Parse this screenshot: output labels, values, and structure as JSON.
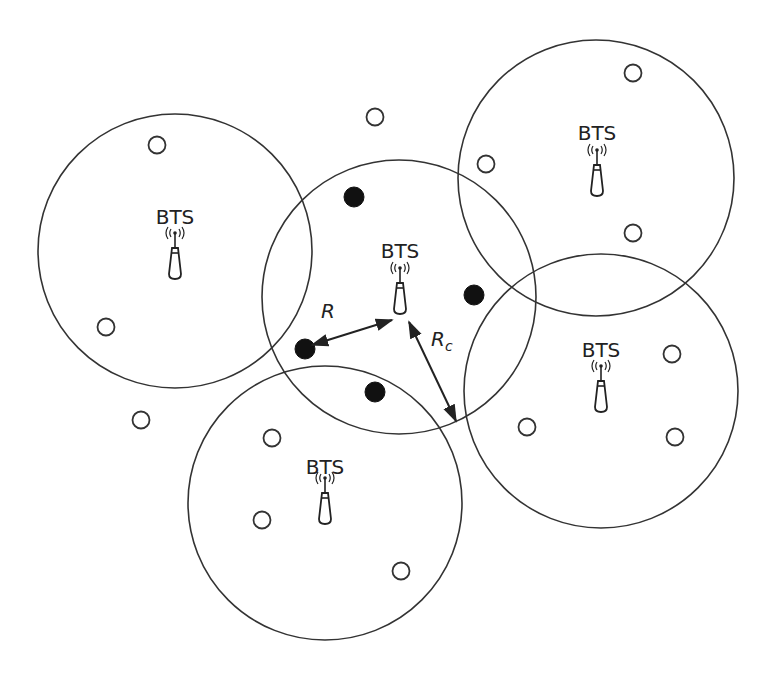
{
  "diagram": {
    "colors": {
      "line": "#333333",
      "active_station": "#111111",
      "idle_station": "#ffffff",
      "background": "#ffffff"
    },
    "cells": [
      {
        "id": "left",
        "label": "BTS",
        "cx": 175,
        "cy": 251,
        "r": 137,
        "label_x": 175,
        "label_y": 224,
        "antenna_x": 175,
        "antenna_y": 226
      },
      {
        "id": "top-right",
        "label": "BTS",
        "cx": 596,
        "cy": 178,
        "r": 138,
        "label_x": 597,
        "label_y": 140,
        "antenna_x": 597,
        "antenna_y": 143
      },
      {
        "id": "center",
        "label": "BTS",
        "cx": 399,
        "cy": 297,
        "r": 137,
        "label_x": 400,
        "label_y": 258,
        "antenna_x": 400,
        "antenna_y": 261
      },
      {
        "id": "bottom-right",
        "label": "BTS",
        "cx": 601,
        "cy": 391,
        "r": 137,
        "label_x": 601,
        "label_y": 357,
        "antenna_x": 601,
        "antenna_y": 359
      },
      {
        "id": "bottom",
        "label": "BTS",
        "cx": 325,
        "cy": 503,
        "r": 137,
        "label_x": 325,
        "label_y": 474,
        "antenna_x": 325,
        "antenna_y": 471
      }
    ],
    "active_mobiles": [
      {
        "x": 354,
        "y": 197
      },
      {
        "x": 474,
        "y": 295
      },
      {
        "x": 305,
        "y": 349
      },
      {
        "x": 375,
        "y": 392
      }
    ],
    "idle_mobiles": [
      {
        "x": 157,
        "y": 145
      },
      {
        "x": 106,
        "y": 327
      },
      {
        "x": 375,
        "y": 117
      },
      {
        "x": 141,
        "y": 420
      },
      {
        "x": 486,
        "y": 164
      },
      {
        "x": 633,
        "y": 73
      },
      {
        "x": 633,
        "y": 233
      },
      {
        "x": 672,
        "y": 354
      },
      {
        "x": 527,
        "y": 427
      },
      {
        "x": 675,
        "y": 437
      },
      {
        "x": 272,
        "y": 438
      },
      {
        "x": 262,
        "y": 520
      },
      {
        "x": 401,
        "y": 571
      }
    ],
    "arrows": {
      "R": {
        "label": "R",
        "x1": 312,
        "y1": 345,
        "x2": 392,
        "y2": 320,
        "label_x": 321,
        "label_y": 318
      },
      "Rc": {
        "label": "R",
        "subscript": "c",
        "x1": 409,
        "y1": 322,
        "x2": 456,
        "y2": 421,
        "label_x": 431,
        "label_y": 346
      }
    }
  }
}
